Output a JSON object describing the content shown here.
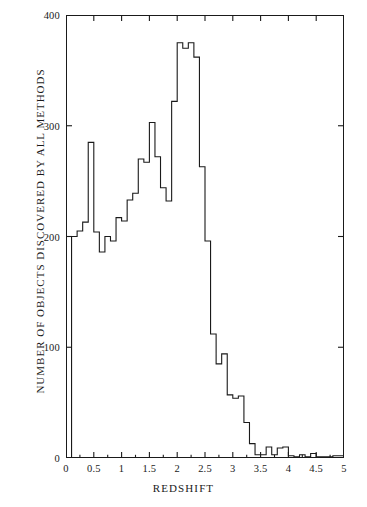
{
  "chart_data": {
    "type": "bar",
    "title": "",
    "subtitle": "",
    "xlabel": "REDSHIFT",
    "ylabel": "NUMBER OF OBJECTS DISCOVERED BY ALL METHODS",
    "xlim": [
      0,
      5
    ],
    "ylim": [
      0,
      400
    ],
    "xticks": [
      0,
      0.5,
      1,
      1.5,
      2,
      2.5,
      3,
      3.5,
      4,
      4.5,
      5
    ],
    "xtick_labels": [
      "0",
      "0.5",
      "1",
      "1.5",
      "2",
      "2.5",
      "3",
      "3.5",
      "4",
      "4.5",
      "5"
    ],
    "yticks": [
      0,
      100,
      200,
      300,
      400
    ],
    "ytick_labels": [
      "0",
      "100",
      "200",
      "300",
      "400"
    ],
    "grid": false,
    "legend": null,
    "bin_width": 0.1,
    "bin_edges": [
      0.0,
      0.1,
      0.2,
      0.3,
      0.4,
      0.5,
      0.6,
      0.7,
      0.8,
      0.9,
      1.0,
      1.1,
      1.2,
      1.3,
      1.4,
      1.5,
      1.6,
      1.7,
      1.8,
      1.9,
      2.0,
      2.1,
      2.2,
      2.3,
      2.4,
      2.5,
      2.6,
      2.7,
      2.8,
      2.9,
      3.0,
      3.1,
      3.2,
      3.3,
      3.4,
      3.5,
      3.6,
      3.7,
      3.8,
      3.9,
      4.0,
      4.1,
      4.2,
      4.3,
      4.4,
      4.5,
      4.6,
      4.7,
      4.8,
      4.9,
      5.0
    ],
    "categories": [
      "0.05",
      "0.15",
      "0.25",
      "0.35",
      "0.45",
      "0.55",
      "0.65",
      "0.75",
      "0.85",
      "0.95",
      "1.05",
      "1.15",
      "1.25",
      "1.35",
      "1.45",
      "1.55",
      "1.65",
      "1.75",
      "1.85",
      "1.95",
      "2.05",
      "2.15",
      "2.25",
      "2.35",
      "2.45",
      "2.55",
      "2.65",
      "2.75",
      "2.85",
      "2.95",
      "3.05",
      "3.15",
      "3.25",
      "3.35",
      "3.45",
      "3.55",
      "3.65",
      "3.75",
      "3.85",
      "3.95",
      "4.05",
      "4.15",
      "4.25",
      "4.35",
      "4.45",
      "4.55",
      "4.65",
      "4.75",
      "4.85",
      "4.95"
    ],
    "values": [
      0,
      200,
      205,
      213,
      285,
      204,
      186,
      200,
      196,
      217,
      214,
      233,
      239,
      270,
      267,
      303,
      272,
      244,
      232,
      322,
      375,
      370,
      375,
      362,
      263,
      196,
      112,
      85,
      94,
      57,
      54,
      56,
      32,
      13,
      3,
      3,
      10,
      3,
      9,
      10,
      2,
      1,
      3,
      1,
      4,
      1,
      1,
      1,
      2,
      2
    ],
    "series_name": "Quasar redshift distribution",
    "line_color": "#1a1a1a",
    "background_color": "#ffffff"
  },
  "axes": {
    "x_title": "REDSHIFT",
    "y_title": "NUMBER OF OBJECTS DISCOVERED BY ALL METHODS"
  }
}
